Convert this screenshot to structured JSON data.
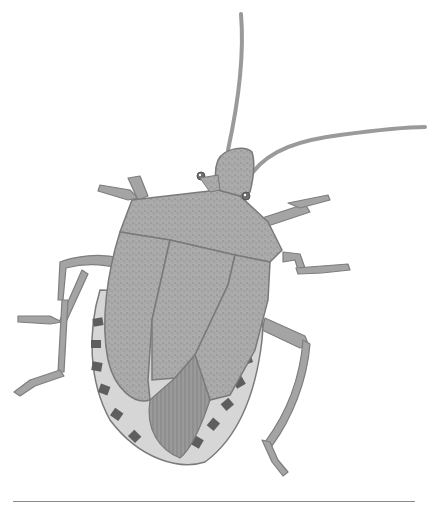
{
  "figure": {
    "style": "grayscale stippled drawing",
    "colors": {
      "background": "#ffffff",
      "body": "#a8a8a8",
      "body_dark": "#8c8c8c",
      "outline": "#7a7a7a",
      "connexivum_dark": "#5e5e5e",
      "connexivum_light": "#d8d8d8",
      "rule": "#8a8a8a"
    }
  },
  "divider": {
    "present": true
  }
}
